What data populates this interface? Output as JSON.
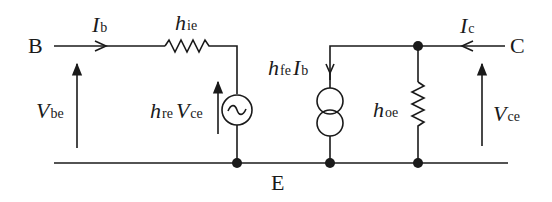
{
  "diagram": {
    "type": "h-parameter small-signal equivalent circuit (common emitter)",
    "terminals": {
      "base": "B",
      "collector": "C",
      "emitter": "E"
    },
    "labels": {
      "ib_main": "I",
      "ib_sub": "b",
      "hie_main": "h",
      "hie_sub": "ie",
      "vbe_main": "V",
      "vbe_sub": "be",
      "hre_main": "h",
      "hre_sub": "re",
      "hre_v_main": "V",
      "hre_v_sub": "ce",
      "hfe_main": "h",
      "hfe_sub": "fe",
      "hfe_i_main": "I",
      "hfe_i_sub": "b",
      "hoe_main": "h",
      "hoe_sub": "oe",
      "ic_main": "I",
      "ic_sub": "c",
      "vce_main": "V",
      "vce_sub": "ce"
    },
    "components": [
      {
        "id": "hie",
        "kind": "resistor",
        "label": "h_ie"
      },
      {
        "id": "hre_vce",
        "kind": "voltage-source (ac)",
        "label": "h_re V_ce"
      },
      {
        "id": "hfe_ib",
        "kind": "current-source",
        "label": "h_fe I_b"
      },
      {
        "id": "hoe",
        "kind": "resistor",
        "label": "h_oe"
      }
    ],
    "colors": {
      "ink": "#1a1a1a",
      "background": "#ffffff"
    }
  }
}
